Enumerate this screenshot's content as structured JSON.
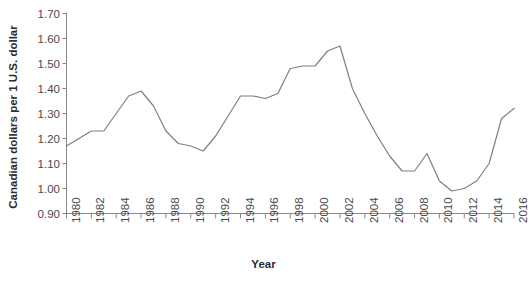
{
  "chart_data": {
    "type": "line",
    "title": "",
    "xlabel": "Year",
    "ylabel": "Canadian dollars per 1 U.S. dollar",
    "xlim": [
      1980,
      2016
    ],
    "ylim": [
      0.9,
      1.7
    ],
    "yticks": [
      "0.90",
      "1.00",
      "1.10",
      "1.20",
      "1.30",
      "1.40",
      "1.50",
      "1.60",
      "1.70"
    ],
    "xticks": [
      "1980",
      "1982",
      "1984",
      "1986",
      "1988",
      "1990",
      "1992",
      "1994",
      "1996",
      "1998",
      "2000",
      "2002",
      "2004",
      "2006",
      "2008",
      "2010",
      "2012",
      "2014",
      "2016"
    ],
    "grid": false,
    "legend": null,
    "line_color": "#7f7f7f",
    "x": [
      1980,
      1981,
      1982,
      1983,
      1984,
      1985,
      1986,
      1987,
      1988,
      1989,
      1990,
      1991,
      1992,
      1993,
      1994,
      1995,
      1996,
      1997,
      1998,
      1999,
      2000,
      2001,
      2002,
      2003,
      2004,
      2005,
      2006,
      2007,
      2008,
      2009,
      2010,
      2011,
      2012,
      2013,
      2014,
      2015,
      2016
    ],
    "values": [
      1.17,
      1.2,
      1.23,
      1.23,
      1.3,
      1.37,
      1.39,
      1.33,
      1.23,
      1.18,
      1.17,
      1.15,
      1.21,
      1.29,
      1.37,
      1.37,
      1.36,
      1.38,
      1.48,
      1.49,
      1.49,
      1.55,
      1.57,
      1.4,
      1.3,
      1.21,
      1.13,
      1.07,
      1.07,
      1.14,
      1.03,
      0.99,
      1.0,
      1.03,
      1.1,
      1.28,
      1.32
    ],
    "series": [
      {
        "name": "CAD per 1 USD",
        "values": [
          1.17,
          1.2,
          1.23,
          1.23,
          1.3,
          1.37,
          1.39,
          1.33,
          1.23,
          1.18,
          1.17,
          1.15,
          1.21,
          1.29,
          1.37,
          1.37,
          1.36,
          1.38,
          1.48,
          1.49,
          1.49,
          1.55,
          1.57,
          1.4,
          1.3,
          1.21,
          1.13,
          1.07,
          1.07,
          1.14,
          1.03,
          0.99,
          1.0,
          1.03,
          1.1,
          1.28,
          1.32
        ]
      }
    ]
  }
}
